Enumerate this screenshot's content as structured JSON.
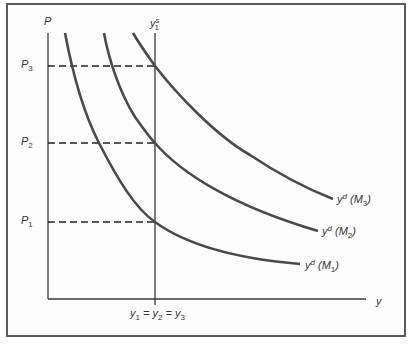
{
  "figure": {
    "axis_y_label": "P",
    "axis_x_label": "y",
    "vertical_line_label": {
      "base": "y",
      "sup": "s",
      "sub": "1"
    },
    "price_levels": [
      {
        "base": "P",
        "sub": "3"
      },
      {
        "base": "P",
        "sub": "2"
      },
      {
        "base": "P",
        "sub": "1"
      }
    ],
    "x_equality_label": {
      "parts": [
        {
          "base": "y",
          "sub": "1"
        },
        {
          "sep": " = "
        },
        {
          "base": "y",
          "sub": "2"
        },
        {
          "sep": " = "
        },
        {
          "base": "y",
          "sub": "3"
        }
      ]
    },
    "curves": [
      {
        "base": "y",
        "sup": "d",
        "arg": "M",
        "sub": "3"
      },
      {
        "base": "y",
        "sup": "d",
        "arg": "M",
        "sub": "2"
      },
      {
        "base": "y",
        "sup": "d",
        "arg": "M",
        "sub": "1"
      }
    ],
    "colors": {
      "curve": "#4a4a4a",
      "axis": "#3a3a3a",
      "frame": "#5a5a5a"
    }
  }
}
